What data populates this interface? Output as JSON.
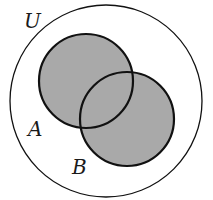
{
  "diagram": {
    "type": "venn",
    "labels": {
      "universe": "U",
      "set_a": "A",
      "set_b": "B"
    },
    "shaded_region": "A ∪ B",
    "colors": {
      "fill": "#a9a9a9",
      "stroke": "#111111",
      "background": "#ffffff"
    }
  }
}
